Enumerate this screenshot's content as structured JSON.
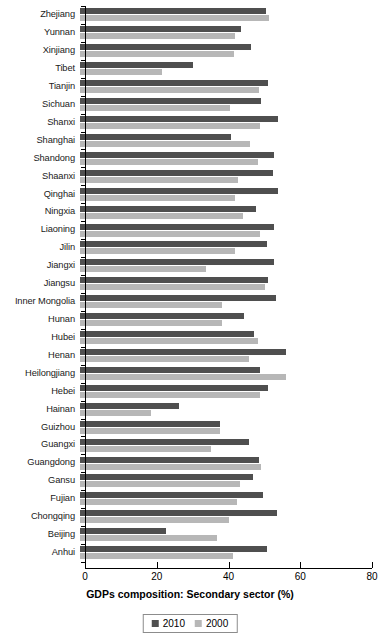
{
  "chart_data": {
    "type": "bar",
    "orientation": "horizontal",
    "title": "",
    "xlabel": "GDPs composition: Secondary sector (%)",
    "ylabel": "",
    "xlim": [
      0,
      80
    ],
    "xticks": [
      0,
      20,
      40,
      60,
      80
    ],
    "grid": false,
    "legend_position": "bottom",
    "colors": {
      "2010": "#4f4f4f",
      "2000": "#b7b7b7",
      "axis": "#000000",
      "background": "#ffffff"
    },
    "categories": [
      "Zhejiang",
      "Yunnan",
      "Xinjiang",
      "Tibet",
      "Tianjin",
      "Sichuan",
      "Shanxi",
      "Shanghai",
      "Shandong",
      "Shaanxi",
      "Qinghai",
      "Ningxia",
      "Liaoning",
      "Jilin",
      "Jiangxi",
      "Jiangsu",
      "Inner Mongolia",
      "Hunan",
      "Hubei",
      "Henan",
      "Heilongjiang",
      "Hebei",
      "Hainan",
      "Guizhou",
      "Guangxi",
      "Guangdong",
      "Gansu",
      "Fujian",
      "Chongqing",
      "Beijing",
      "Anhui"
    ],
    "series": [
      {
        "name": "2010",
        "color": "#4f4f4f",
        "values": [
          51.8,
          45.0,
          47.7,
          31.5,
          52.4,
          50.5,
          55.2,
          42.1,
          54.2,
          53.8,
          55.1,
          49.0,
          54.1,
          52.0,
          54.2,
          52.5,
          54.6,
          45.8,
          48.6,
          57.3,
          50.2,
          52.5,
          27.7,
          39.0,
          47.1,
          50.0,
          48.2,
          51.0,
          55.0,
          24.0,
          52.1
        ]
      },
      {
        "name": "2000",
        "color": "#b7b7b7",
        "values": [
          52.7,
          43.1,
          43.0,
          22.9,
          50.0,
          41.8,
          50.3,
          47.5,
          49.7,
          44.1,
          43.2,
          45.4,
          50.2,
          43.3,
          35.0,
          51.7,
          39.7,
          39.6,
          49.7,
          47.0,
          57.4,
          50.3,
          19.8,
          39.0,
          36.5,
          50.4,
          44.7,
          43.7,
          41.4,
          38.1,
          42.7
        ]
      }
    ]
  },
  "legend": {
    "items": [
      {
        "label": "2010",
        "swatch": "legend-swatch-2010"
      },
      {
        "label": "2000",
        "swatch": "legend-swatch-2000"
      }
    ]
  },
  "axis": {
    "x_title": "GDPs composition: Secondary sector (%)",
    "tick_labels": [
      "0",
      "20",
      "40",
      "60",
      "80"
    ]
  }
}
